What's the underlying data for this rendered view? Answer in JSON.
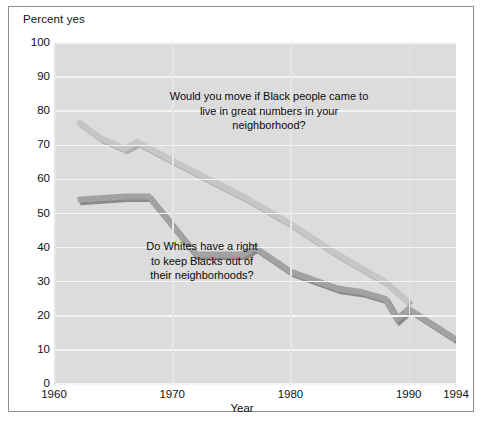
{
  "figure": {
    "y_axis_title": "Percent yes",
    "x_axis_title": "Year",
    "border_color": "#8d8d8d",
    "plot_background": "#dcdcdc",
    "gridline_color": "#f4f4f4"
  },
  "annotations": {
    "upper": "Would you move if Black people came to\nlive in great numbers in your\nneighborhood?",
    "lower": "Do Whites have a right\nto keep Blacks out of\ntheir neighborhoods?"
  },
  "chart_data": {
    "type": "line",
    "title": "",
    "xlabel": "Year",
    "ylabel": "Percent yes",
    "xlim": [
      1960,
      1994
    ],
    "ylim": [
      0,
      100
    ],
    "grid": true,
    "legend": "inline-annotations",
    "ytick_labels": [
      "100",
      "90",
      "80",
      "70",
      "60",
      "50",
      "40",
      "30",
      "20",
      "10",
      "0"
    ],
    "ytick_values": [
      100,
      90,
      80,
      70,
      60,
      50,
      40,
      30,
      20,
      10,
      0
    ],
    "xtick_labels": [
      "1960",
      "1970",
      "1980",
      "1990",
      "1994"
    ],
    "xtick_values": [
      1960,
      1970,
      1980,
      1990,
      1994
    ],
    "series": [
      {
        "name": "Would you move if Black people came to live in great numbers in your neighborhood?",
        "color": "#c6c6c6",
        "shadow_color": "#b0b0b0",
        "x": [
          1962,
          1964,
          1966,
          1967,
          1972,
          1976,
          1980,
          1984,
          1988,
          1990
        ],
        "values": [
          77,
          72,
          69,
          71,
          62,
          55,
          47,
          38,
          30,
          24
        ]
      },
      {
        "name": "Do Whites have a right to keep Blacks out of their neighborhoods?",
        "color": "#a2a2a2",
        "shadow_color": "#8a8a8a",
        "x": [
          1962,
          1966,
          1968,
          1972,
          1976,
          1977,
          1980,
          1984,
          1986,
          1988,
          1989,
          1990,
          1994
        ],
        "values": [
          54,
          55,
          55,
          38,
          38,
          40,
          33,
          28,
          27,
          25,
          19,
          22,
          13
        ]
      }
    ]
  }
}
